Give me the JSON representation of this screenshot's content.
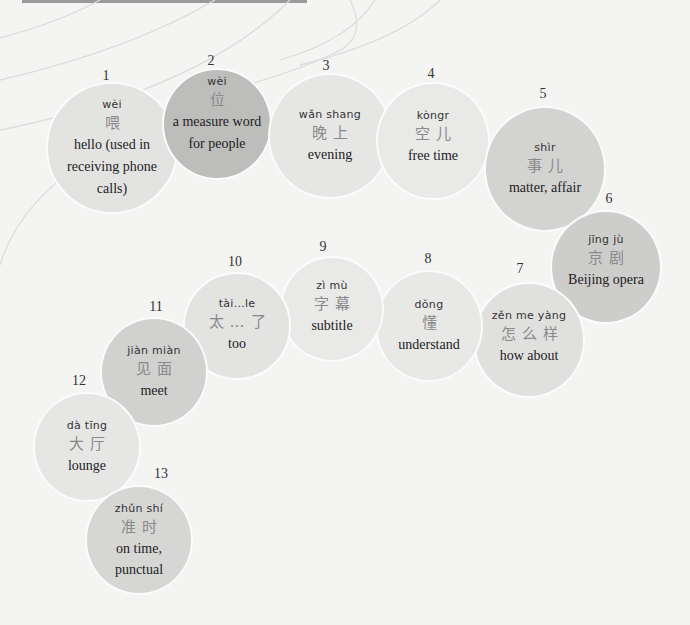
{
  "colors": {
    "background": "#f4f4f3",
    "bubble_light": "#e6e6e5",
    "bubble_mid": "#d8d8d7",
    "bubble_dark": "#bdbdbc"
  },
  "vocabulary": [
    {
      "number": "1",
      "pinyin": "wèi",
      "hanzi": "喂",
      "meaning": "hello (used in receiving phone calls)"
    },
    {
      "number": "2",
      "pinyin": "wèi",
      "hanzi": "位",
      "meaning": "a measure word for people"
    },
    {
      "number": "3",
      "pinyin": "wǎn shang",
      "hanzi": "晚上",
      "meaning": "evening"
    },
    {
      "number": "4",
      "pinyin": "kòngr",
      "hanzi": "空儿",
      "meaning": "free time"
    },
    {
      "number": "5",
      "pinyin": "shìr",
      "hanzi": "事儿",
      "meaning": "matter, affair"
    },
    {
      "number": "6",
      "pinyin": "jīng jù",
      "hanzi": "京剧",
      "meaning": "Beijing opera"
    },
    {
      "number": "7",
      "pinyin": "zěn me yàng",
      "hanzi": "怎么样",
      "meaning": "how about"
    },
    {
      "number": "8",
      "pinyin": "dǒng",
      "hanzi": "懂",
      "meaning": "understand"
    },
    {
      "number": "9",
      "pinyin": "zì mù",
      "hanzi": "字幕",
      "meaning": "subtitle"
    },
    {
      "number": "10",
      "pinyin": "tài…le",
      "hanzi": "太…了",
      "meaning": "too"
    },
    {
      "number": "11",
      "pinyin": "jiàn miàn",
      "hanzi": "见面",
      "meaning": "meet"
    },
    {
      "number": "12",
      "pinyin": "dà tīng",
      "hanzi": "大厅",
      "meaning": "lounge"
    },
    {
      "number": "13",
      "pinyin": "zhǔn shí",
      "hanzi": "准时",
      "meaning": "on time, punctual"
    }
  ]
}
